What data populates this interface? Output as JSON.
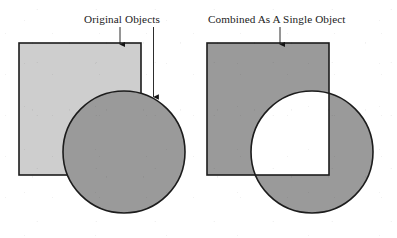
{
  "figure": {
    "background_color": "#ffffff",
    "width": 397,
    "height": 238,
    "top_rule": {
      "color": "#8d8d8d",
      "thickness_px": 1
    }
  },
  "captions": {
    "left": "Original Objects",
    "right": "Combined As A Single Object"
  },
  "colors": {
    "outline": "#1c1c1c",
    "square_light_fill": "#cecece",
    "shape_medium_fill": "#9a9a9a",
    "knockout_fill": "#ffffff",
    "arrow_color": "#151515",
    "paper": "#ffffff"
  },
  "panels": [
    {
      "id": "original-objects",
      "label": "Original Objects",
      "description": "A light gray square with a darker gray circle drawn on top of it, overlapping the square's lower right corner.",
      "shapes": [
        {
          "name": "square",
          "type": "rect",
          "x": 19,
          "y": 43,
          "width": 122,
          "height": 132,
          "fill": "#cecece",
          "stroke": "#1c1c1c",
          "stroke_width": 1.6,
          "z": 1
        },
        {
          "name": "circle",
          "type": "circle",
          "cx": 124,
          "cy": 152,
          "r": 61,
          "fill": "#9a9a9a",
          "stroke": "#1c1c1c",
          "stroke_width": 1.6,
          "z": 2
        }
      ],
      "annotations": [
        {
          "name": "arrow-to-square",
          "target": "square top edge",
          "from_x": 120,
          "from_y": 28,
          "to_x": 120,
          "to_y": 45
        },
        {
          "name": "arrow-to-circle",
          "target": "circle upper right arc",
          "from_x": 153,
          "from_y": 28,
          "to_x": 153,
          "to_y": 99
        }
      ]
    },
    {
      "id": "combined-single-object",
      "label": "Combined As A Single Object",
      "description": "The square and circle merged into one object using exclude-overlap, so the intersecting region is knocked out to white.",
      "operation": "exclude overlap (XOR)",
      "shapes": [
        {
          "name": "square",
          "type": "rect",
          "x": 12,
          "y": 43,
          "width": 122,
          "height": 132,
          "fill": "#9a9a9a",
          "stroke": "#1c1c1c",
          "stroke_width": 1.6,
          "z": 1
        },
        {
          "name": "circle",
          "type": "circle",
          "cx": 117,
          "cy": 152,
          "r": 61,
          "fill": "#9a9a9a",
          "stroke": "#1c1c1c",
          "stroke_width": 1.6,
          "z": 1
        },
        {
          "name": "overlap-knockout",
          "type": "intersection",
          "fill": "#ffffff",
          "z": 2
        }
      ],
      "annotations": [
        {
          "name": "arrow-to-combined-object",
          "target": "combined object top edge",
          "from_x": 85,
          "from_y": 28,
          "to_x": 85,
          "to_y": 45
        }
      ]
    }
  ]
}
